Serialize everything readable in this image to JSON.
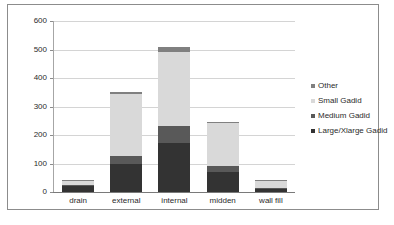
{
  "chart_data": {
    "type": "bar",
    "subtype": "stacked-bar",
    "title": "",
    "xlabel": "",
    "ylabel": "",
    "ylim": [
      0,
      600
    ],
    "yticks": [
      0,
      100,
      200,
      300,
      400,
      500,
      600
    ],
    "ytick_labels": [
      "0",
      "100",
      "200",
      "300",
      "400",
      "500",
      "600"
    ],
    "grid": true,
    "legend_position": "right",
    "categories": [
      "drain",
      "external",
      "internal",
      "midden",
      "wall fill"
    ],
    "series": [
      {
        "name": "Large/Xlarge Gadid",
        "color": "#333333",
        "values": [
          20,
          98,
          172,
          70,
          10
        ]
      },
      {
        "name": "Medium Gadid",
        "color": "#595959",
        "values": [
          5,
          28,
          58,
          20,
          3
        ]
      },
      {
        "name": "Small Gadid",
        "color": "#d9d9d9",
        "values": [
          12,
          218,
          262,
          152,
          25
        ]
      },
      {
        "name": "Other",
        "color": "#808080",
        "values": [
          3,
          7,
          18,
          5,
          2
        ]
      }
    ],
    "totals": [
      40,
      351,
      510,
      247,
      40
    ]
  },
  "legend": {
    "entries": [
      {
        "label": "Other",
        "color": "#808080"
      },
      {
        "label": "Small Gadid",
        "color": "#d9d9d9"
      },
      {
        "label": "Medium Gadid",
        "color": "#595959"
      },
      {
        "label": "Large/Xlarge Gadid",
        "color": "#333333"
      }
    ]
  },
  "caption": {
    "text": ""
  },
  "colors": {
    "frame_border": "#8c8c8c",
    "axis_line": "#7a7a7a",
    "gridline": "#d4d4d4",
    "text": "#2b2b2b",
    "background": "#ffffff"
  }
}
